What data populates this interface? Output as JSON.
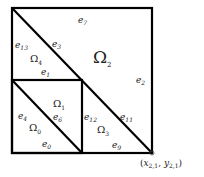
{
  "diagram": {
    "type": "triangular mesh of unit square",
    "colors": {
      "line": "#000000",
      "text": "#222222",
      "background": "#ffffff"
    },
    "outer_square": {
      "x0": 12,
      "y0": 8,
      "x1": 152,
      "y1": 153
    },
    "inner_square": {
      "x0": 12,
      "y0": 80,
      "x1": 82,
      "y1": 153
    },
    "diagonals": [
      {
        "from": [
          12,
          8
        ],
        "to": [
          152,
          153
        ]
      },
      {
        "from": [
          12,
          80
        ],
        "to": [
          82,
          153
        ]
      }
    ],
    "regions": [
      {
        "id": "omega0",
        "base": "Ω",
        "sub": "0"
      },
      {
        "id": "omega1",
        "base": "Ω",
        "sub": "1"
      },
      {
        "id": "omega2",
        "base": "Ω",
        "sub": "2"
      },
      {
        "id": "omega3",
        "base": "Ω",
        "sub": "3"
      },
      {
        "id": "omega4",
        "base": "Ω",
        "sub": "4"
      }
    ],
    "edges": [
      {
        "id": "e0",
        "base": "e",
        "sub": "0"
      },
      {
        "id": "e1",
        "base": "e",
        "sub": "1"
      },
      {
        "id": "e2",
        "base": "e",
        "sub": "2"
      },
      {
        "id": "e3",
        "base": "e",
        "sub": "3"
      },
      {
        "id": "e4",
        "base": "e",
        "sub": "4"
      },
      {
        "id": "e6",
        "base": "e",
        "sub": "6"
      },
      {
        "id": "e7",
        "base": "e",
        "sub": "7"
      },
      {
        "id": "e9",
        "base": "e",
        "sub": "9"
      },
      {
        "id": "e11",
        "base": "e",
        "sub": "11"
      },
      {
        "id": "e12",
        "base": "e",
        "sub": "12"
      },
      {
        "id": "e13",
        "base": "e",
        "sub": "13"
      }
    ],
    "point_label": {
      "open": "(",
      "x": "x",
      "x_sub": "2,1",
      "sep": ", ",
      "y": "y",
      "y_sub": "2,1",
      "close": ")"
    }
  }
}
